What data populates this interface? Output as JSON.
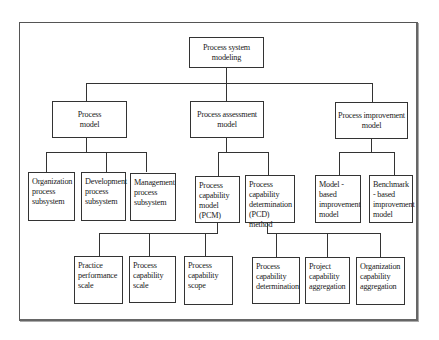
{
  "diagram": {
    "type": "hierarchy-tree",
    "root": {
      "label": "Process system modeling"
    },
    "level1": [
      {
        "label": "Process model"
      },
      {
        "label": "Process assessment model"
      },
      {
        "label": "Process improvement model"
      }
    ],
    "level2": {
      "process_model_children": [
        {
          "label": "Organization process subsystem"
        },
        {
          "label": "Development process subsystem"
        },
        {
          "label": "Management process subsystem"
        }
      ],
      "assessment_model_children": [
        {
          "label": "Process capability model (PCM)"
        },
        {
          "label": "Process capability determination (PCD) method"
        }
      ],
      "improvement_model_children": [
        {
          "label": "Model - based improvement model"
        },
        {
          "label": "Benchmark - based improvement model"
        }
      ]
    },
    "level3": {
      "pcm_children": [
        {
          "label": "Practice performance scale"
        },
        {
          "label": "Process capability scale"
        },
        {
          "label": "Process capability scope"
        }
      ],
      "pcd_children": [
        {
          "label": "Process capability determination"
        },
        {
          "label": "Project capability aggregation"
        },
        {
          "label": "Organization capability aggregation"
        }
      ]
    },
    "colors": {
      "line": "#333333",
      "frame": "#555555",
      "background": "#ffffff",
      "text": "#222222"
    }
  }
}
